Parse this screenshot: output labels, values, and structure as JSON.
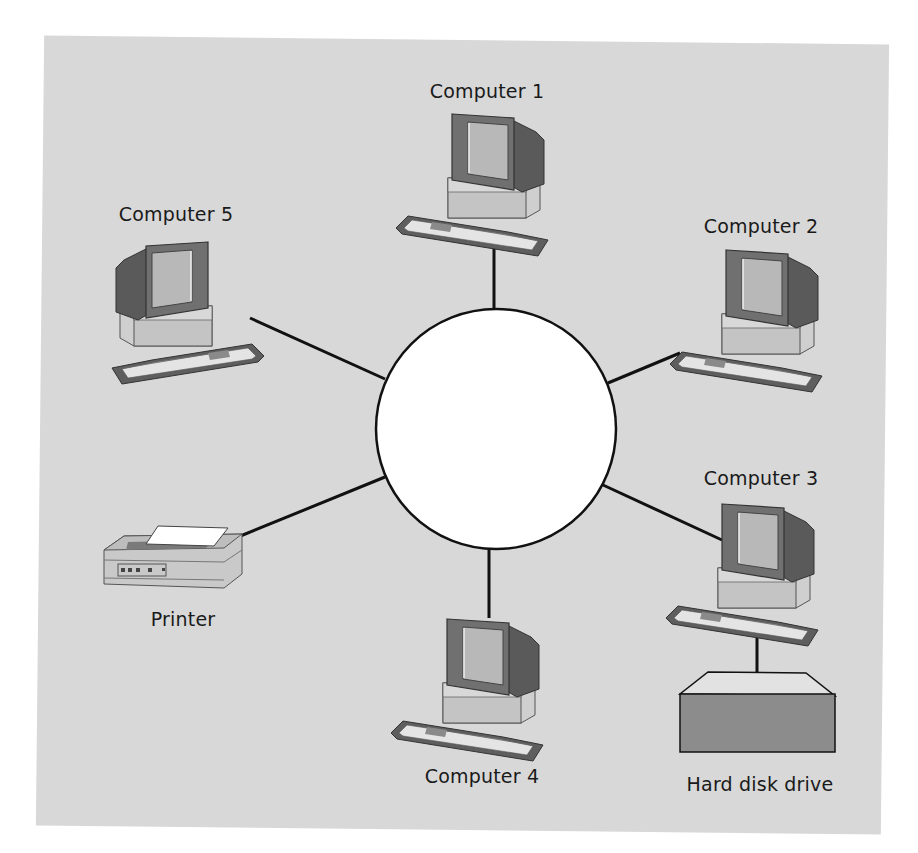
{
  "diagram": {
    "type": "star-network-topology",
    "hub": {
      "shape": "circle",
      "fill": "#ffffff",
      "stroke": "#111111"
    },
    "nodes": [
      {
        "id": "computer1",
        "label": "Computer 1",
        "kind": "computer"
      },
      {
        "id": "computer2",
        "label": "Computer 2",
        "kind": "computer"
      },
      {
        "id": "computer3",
        "label": "Computer 3",
        "kind": "computer"
      },
      {
        "id": "computer4",
        "label": "Computer 4",
        "kind": "computer"
      },
      {
        "id": "computer5",
        "label": "Computer 5",
        "kind": "computer"
      },
      {
        "id": "printer",
        "label": "Printer",
        "kind": "printer"
      },
      {
        "id": "harddisk",
        "label": "Hard disk drive",
        "kind": "storage"
      }
    ],
    "edges": [
      [
        "hub",
        "computer1"
      ],
      [
        "hub",
        "computer2"
      ],
      [
        "hub",
        "computer3"
      ],
      [
        "hub",
        "computer4"
      ],
      [
        "hub",
        "computer5"
      ],
      [
        "hub",
        "printer"
      ],
      [
        "computer3",
        "harddisk"
      ]
    ],
    "colors": {
      "background": "#d8d8d8",
      "line": "#111111",
      "monitor_dark": "#6a6a6a",
      "screen": "#b4b4b4",
      "base": "#c8c8c8",
      "drive_front": "#8c8c8c",
      "drive_top": "#e0e0e0"
    }
  }
}
